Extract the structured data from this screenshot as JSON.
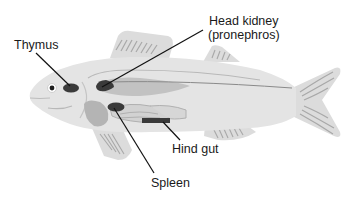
{
  "diagram": {
    "labels": {
      "thymus": "Thymus",
      "head_kidney_line1": "Head kidney",
      "head_kidney_line2": "(pronephros)",
      "hind_gut": "Hind gut",
      "spleen": "Spleen"
    },
    "colors": {
      "body": "#e4e4e4",
      "fins": "#dcdcdc",
      "fin_rays": "#a8a8a8",
      "internal_light": "#c8c8c8",
      "internal_mid": "#b0b0b0",
      "organ_dark": "#3a3a3a",
      "leader_line": "#111111",
      "lateral_line": "#8a8a8a"
    }
  }
}
